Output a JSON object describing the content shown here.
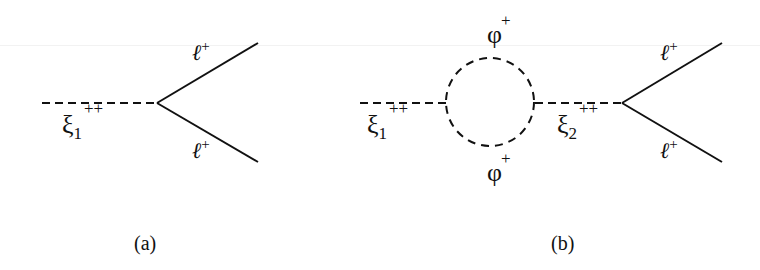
{
  "diagrams": [
    {
      "id": "a",
      "caption": "(a)",
      "incoming": {
        "particle": "ξ",
        "subscript": "1",
        "charge": "++"
      },
      "outgoing": [
        {
          "particle": "ℓ",
          "charge": "+"
        },
        {
          "particle": "ℓ",
          "charge": "+"
        }
      ]
    },
    {
      "id": "b",
      "caption": "(b)",
      "incoming": {
        "particle": "ξ",
        "subscript": "1",
        "charge": "++"
      },
      "loop": [
        {
          "particle": "φ",
          "charge": "+"
        },
        {
          "particle": "φ",
          "charge": "+"
        }
      ],
      "intermediate": {
        "particle": "ξ",
        "subscript": "2",
        "charge": "++"
      },
      "outgoing": [
        {
          "particle": "ℓ",
          "charge": "+"
        },
        {
          "particle": "ℓ",
          "charge": "+"
        }
      ]
    }
  ],
  "colors": {
    "line": "#111111",
    "background": "#ffffff"
  }
}
